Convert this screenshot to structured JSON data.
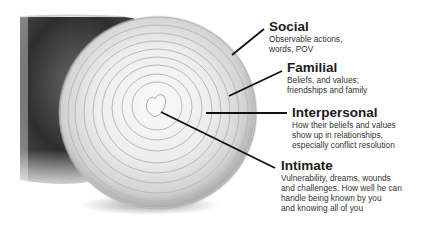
{
  "diagram": {
    "type": "onion-layers",
    "image": "halved-onion-photo",
    "layers": [
      {
        "title": "Social",
        "description_lines": [
          "Observable actions,",
          "words, POV"
        ]
      },
      {
        "title": "Familial",
        "description_lines": [
          "Beliefs, and values;",
          "friendships and family"
        ]
      },
      {
        "title": "Interpersonal",
        "description_lines": [
          "How their beliefs and values",
          "show up in relationships,",
          "especially conflict resolution"
        ]
      },
      {
        "title": "Intimate",
        "description_lines": [
          "Vulnerability, dreams, wounds",
          "and challenges. How well he can",
          "handle being known by you",
          "and knowing all of you"
        ]
      }
    ]
  }
}
